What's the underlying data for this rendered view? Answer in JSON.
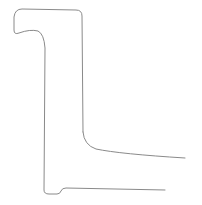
{
  "drawing": {
    "subject": "sketch-outline",
    "stroke_color": "#8a8a8a",
    "stroke_width": 1,
    "background": "#ffffff",
    "paths": {
      "outline_left_and_top": "M 83,132 L 82,16 Q 82,10 76,10 L 22,9 Q 15,9 14,17 L 14,30 Q 14,35 19,33 Q 30,29 38,31 Q 44,34 45,48 L 44,190 Q 44,194 49,194 L 57,194 Q 60,194 61,191 Q 62,188 66,188 L 165,190",
      "outline_right_foot": "M 83,132 Q 84,145 96,149 Q 120,154 185,158"
    }
  }
}
